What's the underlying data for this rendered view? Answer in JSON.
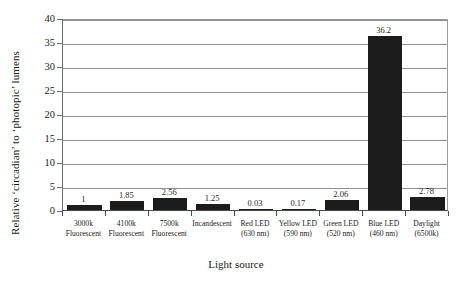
{
  "chart_data": {
    "type": "bar",
    "title": "",
    "xlabel": "Light source",
    "ylabel": "Relative ‘circadian’ to ‘photopic’ lumens",
    "ylim": [
      0,
      40
    ],
    "yticks": [
      0,
      5,
      10,
      15,
      20,
      25,
      30,
      35,
      40
    ],
    "ytick_labels": [
      "0",
      "5",
      "10",
      "15",
      "20",
      "25",
      "30",
      "35",
      "40"
    ],
    "grid": true,
    "grid_axis": "y",
    "legend": false,
    "bar_color": "#1c1c1c",
    "categories": [
      "3000k Fluorescent",
      "4100k Fluorescent",
      "7500k Fluorescent",
      "Incandescent",
      "Red LED (630 nm)",
      "Yellow LED (590 nm)",
      "Green LED (520 nm)",
      "Blue LED (460 nm)",
      "Daylight (6500k)"
    ],
    "category_lines": [
      [
        "3000k",
        "Fluorescent"
      ],
      [
        "4100k",
        "Fluorescent"
      ],
      [
        "7500k",
        "Fluorescent"
      ],
      [
        "Incandescent",
        ""
      ],
      [
        "Red LED",
        "(630 nm)"
      ],
      [
        "Yellow LED",
        "(590 nm)"
      ],
      [
        "Green LED",
        "(520 nm)"
      ],
      [
        "Blue LED",
        "(460 nm)"
      ],
      [
        "Daylight",
        "(6500k)"
      ]
    ],
    "values": [
      1,
      1.85,
      2.56,
      1.25,
      0.03,
      0.17,
      2.06,
      36.2,
      2.78
    ],
    "value_labels": [
      "1",
      "1.85",
      "2.56",
      "1.25",
      "0.03",
      "0.17",
      "2.06",
      "36.2",
      "2.78"
    ]
  }
}
